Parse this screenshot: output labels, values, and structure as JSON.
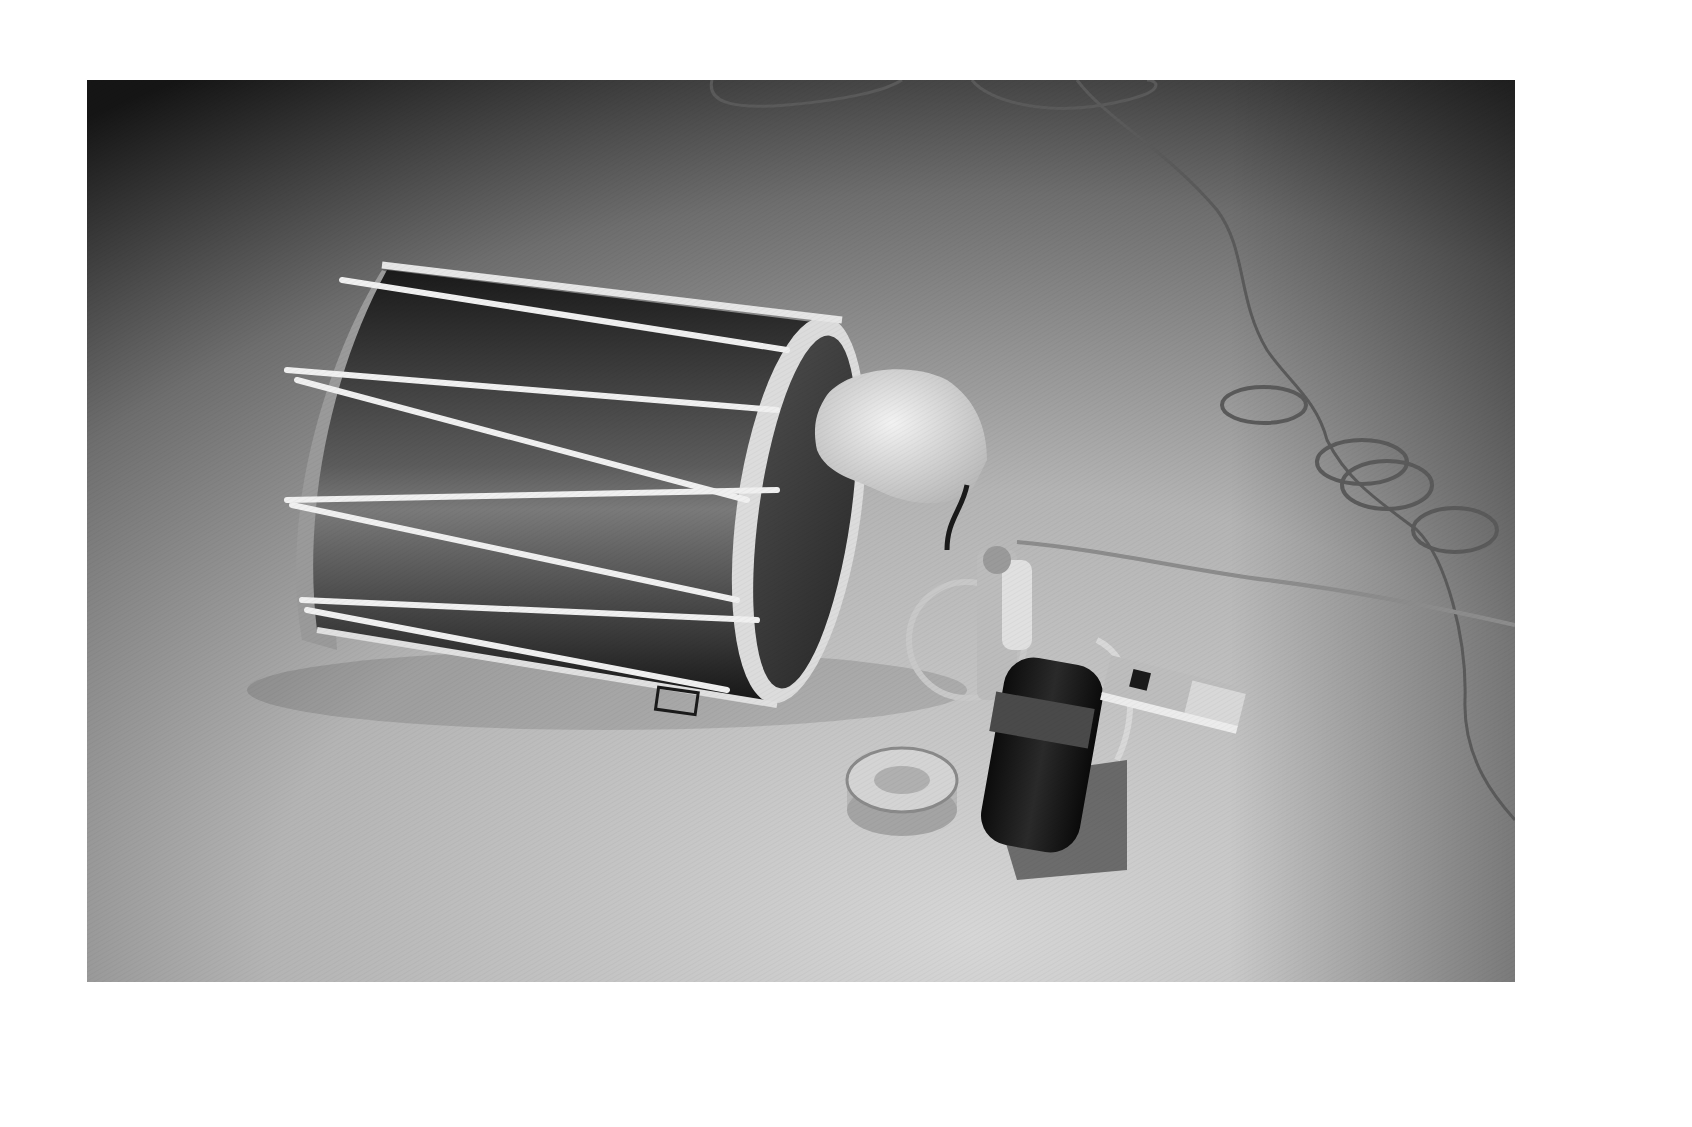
{
  "page": {
    "background": "#ffffff"
  },
  "photo": {
    "description": "Black-and-white photograph of a laced cylindrical drum lying on its side on a floor, with a pale rubber-like mass pressed against the drum head, wired to a small mechanical device with an electric motor, a metal ring/toroid, and a flat connector; cables coil across the floor",
    "tones": {
      "floor_light": "#cfcfcf",
      "floor_mid": "#a8a8a8",
      "floor_dark": "#1c1c1c",
      "drum_shell": "#2a2a2a",
      "drum_highlight": "#8a8a8a",
      "rope": "#eeeeee",
      "rim": "#d8d8d8",
      "motor": "#111111",
      "cable": "#6a6a6a"
    },
    "objects": [
      {
        "name": "drum",
        "label": "laced drum lying on side"
      },
      {
        "name": "rubber-mass",
        "label": "pale molded mass on drum head"
      },
      {
        "name": "mechanism",
        "label": "wired metal mechanism"
      },
      {
        "name": "motor",
        "label": "black cylindrical motor"
      },
      {
        "name": "toroid",
        "label": "metal ring coil"
      },
      {
        "name": "connector",
        "label": "flat metal connector plug"
      },
      {
        "name": "cables",
        "label": "looped cables on floor"
      }
    ]
  }
}
